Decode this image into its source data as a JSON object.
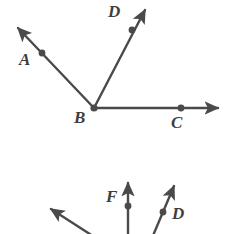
{
  "figure": {
    "stroke_color": "#4a4a4a",
    "label_color": "#3d3d3d",
    "background_color": "#ffffff",
    "stroke_width": 2.4,
    "dot_radius": 3.4,
    "width": 229,
    "height": 234
  },
  "upper_figure": {
    "name": "angle-abc-abd-dbc",
    "vertex": {
      "label": "B",
      "x": 94,
      "y": 108,
      "label_x": 74,
      "label_y": 109
    },
    "rays": [
      {
        "name": "ray-ba",
        "label": "A",
        "label_x": 19,
        "label_y": 51,
        "from_x": 94,
        "from_y": 108,
        "to_x": 14,
        "to_y": 24,
        "dot_x": 42,
        "dot_y": 53,
        "arrow": true
      },
      {
        "name": "ray-bd",
        "label": "D",
        "label_x": 108,
        "label_y": 3,
        "from_x": 94,
        "from_y": 108,
        "to_x": 148,
        "to_y": 5,
        "dot_x": 132,
        "dot_y": 30,
        "arrow": true
      },
      {
        "name": "ray-bc",
        "label": "C",
        "label_x": 171,
        "label_y": 114,
        "from_x": 94,
        "from_y": 108,
        "to_x": 224,
        "to_y": 108,
        "dot_x": 181,
        "dot_y": 108,
        "arrow": true
      }
    ]
  },
  "lower_figure": {
    "name": "partial-cropped-angle-figure",
    "cropped": true,
    "rays": [
      {
        "name": "ray-left-partial",
        "label": "",
        "from_x": 96,
        "from_y": 238,
        "to_x": 47,
        "to_y": 206,
        "arrow": true,
        "dot": false
      },
      {
        "name": "ray-f",
        "label": "F",
        "label_x": 106,
        "label_y": 188,
        "from_x": 128,
        "from_y": 238,
        "to_x": 128,
        "to_y": 177,
        "dot_x": 128,
        "dot_y": 206,
        "arrow": true
      },
      {
        "name": "ray-d-lower",
        "label": "D",
        "label_x": 172,
        "label_y": 205,
        "from_x": 152,
        "from_y": 238,
        "to_x": 176,
        "to_y": 180,
        "dot_x": 163,
        "dot_y": 212,
        "arrow": true
      }
    ]
  }
}
